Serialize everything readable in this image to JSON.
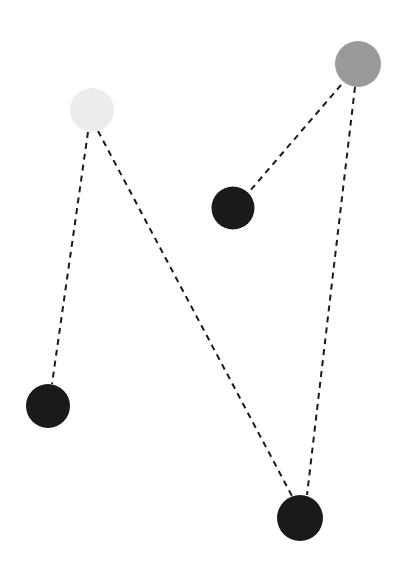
{
  "canvas": {
    "width": 402,
    "height": 566,
    "background_color": "#ffffff",
    "title": "Node and dashed-edge diagram"
  },
  "style": {
    "edge_color": "#1a1a1a",
    "edge_width": 2,
    "edge_dash": "6 5",
    "node_stroke": "none"
  },
  "chart_data": {
    "type": "scatter",
    "title": "",
    "xlabel": "",
    "ylabel": "",
    "xlim": [
      0,
      402
    ],
    "ylim": [
      0,
      566
    ],
    "grid": false,
    "legend": "none",
    "nodes": [
      {
        "id": "node-light-top-left",
        "label": "light gray node",
        "x": 92,
        "y": 110,
        "r": 22,
        "color": "#ececec",
        "shade": "light"
      },
      {
        "id": "node-gray-top-right",
        "label": "medium gray node",
        "x": 358,
        "y": 64,
        "r": 23,
        "color": "#9a9a9a",
        "shade": "medium"
      },
      {
        "id": "node-black-middle",
        "label": "black node middle",
        "x": 233,
        "y": 208,
        "r": 21.5,
        "color": "#1a1a1a",
        "shade": "dark"
      },
      {
        "id": "node-black-bottom-left",
        "label": "black node bottom left",
        "x": 48,
        "y": 406,
        "r": 22,
        "color": "#1a1a1a",
        "shade": "dark"
      },
      {
        "id": "node-black-bottom-right",
        "label": "black node bottom right",
        "x": 300,
        "y": 518,
        "r": 23,
        "color": "#1a1a1a",
        "shade": "dark"
      }
    ],
    "edges": [
      {
        "id": "edge-light-to-bottom-left",
        "from": "node-light-top-left",
        "to": "node-black-bottom-left",
        "x1": 88,
        "y1": 132,
        "x2": 52,
        "y2": 384,
        "style": "dashed"
      },
      {
        "id": "edge-light-to-bottom-right",
        "from": "node-light-top-left",
        "to": "node-black-bottom-right",
        "x1": 98,
        "y1": 131,
        "x2": 292,
        "y2": 496,
        "style": "dashed"
      },
      {
        "id": "edge-gray-to-middle-black",
        "from": "node-gray-top-right",
        "to": "node-black-middle",
        "x1": 341,
        "y1": 85,
        "x2": 249,
        "y2": 192,
        "style": "dashed"
      },
      {
        "id": "edge-gray-to-bottom-right",
        "from": "node-gray-top-right",
        "to": "node-black-bottom-right",
        "x1": 355,
        "y1": 87,
        "x2": 307,
        "y2": 495,
        "style": "dashed"
      }
    ]
  }
}
